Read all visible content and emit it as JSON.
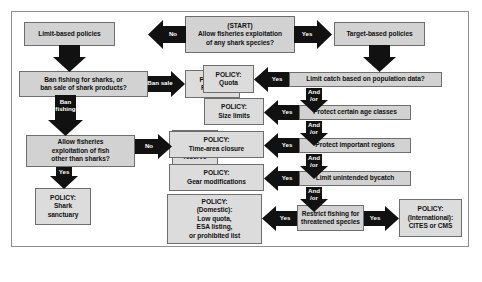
{
  "figure": {
    "border_color": "#8d8d8d",
    "box_fill": "#d2d2d2",
    "policy_fill": "#dcdcdc",
    "arrow_color": "#111111"
  },
  "nodes": {
    "limit_based": {
      "label": "Limit-based policies"
    },
    "start": {
      "line1": "(START)",
      "line2": "Allow fisheries exploitation",
      "line3": "of any shark species?"
    },
    "target_based": {
      "label": "Target-based policies"
    },
    "ban_question": {
      "line1": "Ban fishing for sharks, or",
      "line2": "ban sale of shark products?"
    },
    "policy_fin_ban": {
      "line1": "POLICY:",
      "line2": "Fin ban"
    },
    "policy_quota": {
      "line1": "POLICY:",
      "line2": "Quota"
    },
    "limit_catch": {
      "label": "Limit catch based on population data?"
    },
    "allow_other_fish": {
      "line1": "Allow fisheries",
      "line2": "exploitation of fish",
      "line3": "other than sharks?"
    },
    "policy_marine_reserve": {
      "line1": "POLICY:",
      "line2": "Marine",
      "line3": "reserve"
    },
    "policy_size_limits": {
      "line1": "POLICY:",
      "line2": "Size limits"
    },
    "protect_age_classes": {
      "label": "Protect certain age classes"
    },
    "policy_shark_sanctuary": {
      "line1": "POLICY:",
      "line2": "Shark",
      "line3": "sanctuary"
    },
    "policy_time_area": {
      "line1": "POLICY:",
      "line2": "Time-area closure"
    },
    "protect_regions": {
      "label": "Protect important regions"
    },
    "policy_gear_mods": {
      "line1": "POLICY:",
      "line2": "Gear modifications"
    },
    "limit_bycatch": {
      "label": "Limit unintended bycatch"
    },
    "policy_domestic": {
      "line1": "POLICY:",
      "line2": "(Domestic):",
      "line3": "Low quota,",
      "line4": "ESA listing,",
      "line5": "or prohibited list"
    },
    "restrict_fishing": {
      "line1": "Restrict fishing for",
      "line2": "threatened species"
    },
    "policy_international": {
      "line1": "POLICY:",
      "line2": "(International):",
      "line3": "CITES or CMS"
    }
  },
  "arrow_labels": {
    "no_start_left": "No",
    "yes_start_right": "Yes",
    "ban_sale": "Ban sale",
    "ban_fishing": "Ban\nfishing",
    "no_other_fish": "No",
    "yes_other_fish": "Yes",
    "yes_quota": "Yes",
    "and_or_1": "And\n/or",
    "yes_size_limits": "Yes",
    "and_or_2": "And\n/or",
    "yes_time_area": "Yes",
    "and_or_3": "And\n/or",
    "yes_gear_mods": "Yes",
    "and_or_4": "And\n/or",
    "yes_domestic": "Yes",
    "yes_international": "Yes"
  }
}
